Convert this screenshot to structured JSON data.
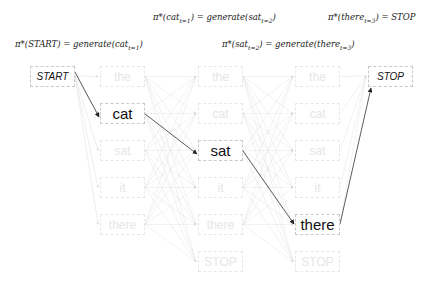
{
  "formulas": {
    "top_left": {
      "pi": "π*(",
      "word": "cat",
      "sub": "t=1",
      "mid": ") = generate(",
      "word2": "sat",
      "sub2": "t=2",
      "end": ")"
    },
    "top_right": {
      "pi": "π*(",
      "word": "there",
      "sub": "t=3",
      "end": ") = STOP"
    },
    "bottom_left": {
      "pi": "π*(START) = generate(",
      "word": "cat",
      "sub": "t=1",
      "end": ")"
    },
    "bottom_right": {
      "pi": "π*(",
      "word": "sat",
      "sub": "t=2",
      "mid": ") = generate(",
      "word2": "there",
      "sub2": "t=3",
      "end": ")"
    }
  },
  "start_label": "START",
  "stop_label": "STOP",
  "columns": [
    {
      "step": 1,
      "tokens": [
        "the",
        "cat",
        "sat",
        "it",
        "there"
      ],
      "selected": "cat"
    },
    {
      "step": 2,
      "tokens": [
        "the",
        "cat",
        "sat",
        "it",
        "there",
        "STOP"
      ],
      "selected": "sat"
    },
    {
      "step": 3,
      "tokens": [
        "the",
        "cat",
        "sat",
        "it",
        "there",
        "STOP"
      ],
      "selected": "there"
    }
  ],
  "greedy_path": [
    "START",
    "cat",
    "sat",
    "there",
    "STOP"
  ],
  "colors": {
    "active_edge": "#333333",
    "faded_edge": "#dddddd",
    "faded_text": "#e6e6e6"
  }
}
